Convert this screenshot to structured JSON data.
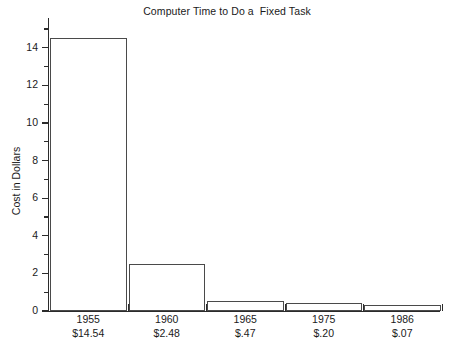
{
  "chart_data": {
    "type": "bar",
    "title": "Computer Time to Do a  Fixed Task",
    "xlabel": "",
    "ylabel": "Cost in Dollars",
    "categories": [
      "1955",
      "1960",
      "1965",
      "1975",
      "1986"
    ],
    "category_sublabels": [
      "$14.54",
      "$2.48",
      "$.47",
      "$.20",
      "$.07"
    ],
    "values": [
      14.54,
      2.48,
      0.47,
      0.2,
      0.07
    ],
    "plotted_heights": [
      14.5,
      2.5,
      0.55,
      0.4,
      0.3
    ],
    "ylim": [
      0,
      15
    ],
    "ytick_major": [
      0,
      2,
      4,
      6,
      8,
      10,
      12,
      14
    ],
    "ytick_minor": [
      1,
      3,
      5,
      7,
      9,
      11,
      13,
      15
    ],
    "ytick_labels": [
      "0",
      "2",
      "4",
      "6",
      "8",
      "10",
      "12",
      "14"
    ],
    "grid": false,
    "legend": false,
    "bar_fill_color": "#ffffff",
    "bar_border_color": "#4a4a4a",
    "axis_color": "#2b2b2b",
    "text_color": "#1a1a1a",
    "background_color": "#ffffff"
  }
}
